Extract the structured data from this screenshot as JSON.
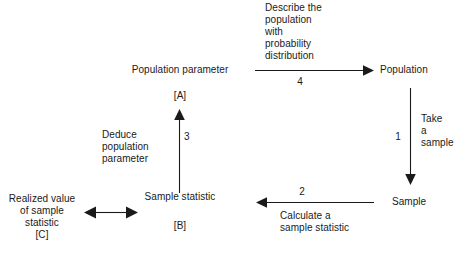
{
  "diagram": {
    "type": "flow-diagram",
    "background_color": "#ffffff",
    "line_color": "#1a1a1a",
    "nodes": [
      {
        "id": "population_parameter",
        "label": "Population parameter",
        "tag": "[A]"
      },
      {
        "id": "population",
        "label": "Population"
      },
      {
        "id": "sample",
        "label": "Sample"
      },
      {
        "id": "sample_statistic",
        "label": "Sample statistic",
        "tag": "[B]"
      },
      {
        "id": "realized_value",
        "label_line1": "Realized value",
        "label_line2": "of sample",
        "label_line3": "statistic",
        "tag": "[C]"
      }
    ],
    "edges": [
      {
        "id": "edge-4",
        "number": "4",
        "caption_line1": "Describe the",
        "caption_line2": "population",
        "caption_line3": "with",
        "caption_line4": "probability",
        "caption_line5": "distribution",
        "direction": "right"
      },
      {
        "id": "edge-1",
        "number": "1",
        "caption_line1": "Take",
        "caption_line2": "a",
        "caption_line3": "sample",
        "direction": "down"
      },
      {
        "id": "edge-2",
        "number": "2",
        "caption_line1": "Calculate a",
        "caption_line2": "sample statistic",
        "direction": "left"
      },
      {
        "id": "edge-3",
        "number": "3",
        "caption_line1": "Deduce",
        "caption_line2": "population",
        "caption_line3": "parameter",
        "direction": "up"
      },
      {
        "id": "edge-equivalence",
        "number": "",
        "direction": "both"
      }
    ]
  }
}
